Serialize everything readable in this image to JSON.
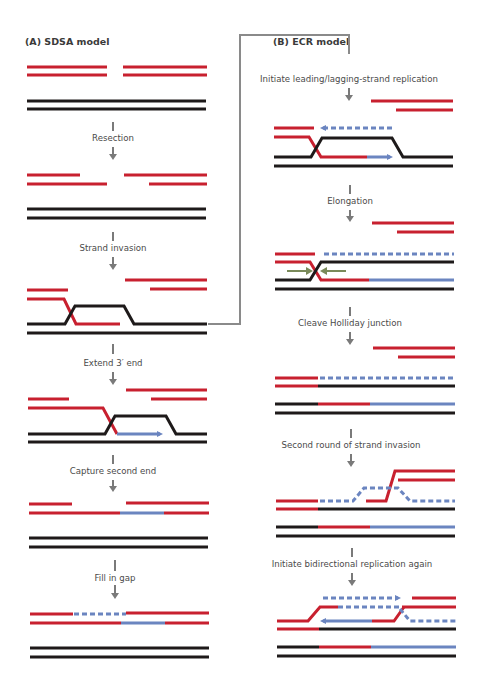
{
  "panels": {
    "a": {
      "title": "(A)  SDSA model",
      "steps": [
        {
          "label": "Resection"
        },
        {
          "label": "Strand invasion"
        },
        {
          "label": "Extend 3′ end"
        },
        {
          "label": "Capture second end"
        },
        {
          "label": "Fill in gap"
        }
      ]
    },
    "b": {
      "title": "(B)  ECR model",
      "steps": [
        {
          "label": "Initiate leading/lagging-strand replication"
        },
        {
          "label": "Elongation"
        },
        {
          "label": "Cleave Holliday junction"
        },
        {
          "label": "Second round of strand invasion"
        },
        {
          "label": "Initiate bidirectional replication again"
        }
      ]
    }
  },
  "colors": {
    "broken_dna": "#c8202f",
    "template_dna": "#1e1a1a",
    "new_synthesis": "#6b85c0",
    "junction_arrows": "#7a8a5a",
    "connector": "#8a8a8a"
  },
  "icons": {
    "step_arrow": "down-arrow-icon",
    "synthesis_arrow": "right-arrow-icon",
    "cleave_arrows": "converging-arrows-icon"
  }
}
